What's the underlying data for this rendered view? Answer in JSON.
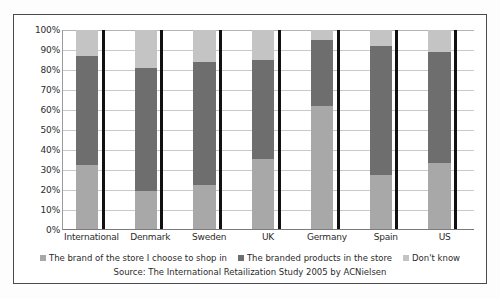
{
  "chart_data": {
    "type": "bar",
    "subtype": "stacked-100-percent",
    "title": "",
    "subtitle": "",
    "xlabel": "",
    "ylabel": "",
    "ylim": [
      0,
      100
    ],
    "grid": true,
    "legend_position": "bottom",
    "y_tick_labels": [
      "100%",
      "90%",
      "80%",
      "70%",
      "60%",
      "50%",
      "40%",
      "30%",
      "20%",
      "10%",
      "0%"
    ],
    "y_tick_values": [
      100,
      90,
      80,
      70,
      60,
      50,
      40,
      30,
      20,
      10,
      0
    ],
    "categories": [
      "International",
      "Denmark",
      "Sweden",
      "UK",
      "Germany",
      "Spain",
      "US"
    ],
    "series": [
      {
        "name": "The brand of the store I choose to shop in",
        "color": "#a8a8a8",
        "values": [
          32,
          19,
          22,
          35,
          62,
          27,
          33
        ]
      },
      {
        "name": "The branded products in the store",
        "color": "#6e6e6e",
        "values": [
          55,
          62,
          62,
          50,
          33,
          65,
          56
        ]
      },
      {
        "name": "Don't know",
        "color": "#c4c4c4",
        "values": [
          13,
          19,
          16,
          15,
          5,
          8,
          11
        ]
      }
    ],
    "source_note": "Source: The International Retailization Study 2005 by ACNielsen"
  },
  "colors": {
    "series_1": "#a8a8a8",
    "series_2": "#6e6e6e",
    "series_3": "#c4c4c4",
    "separator": "#111114",
    "gridline": "#c9c9c9",
    "frame_border": "#4a4a52",
    "text": "#2b2b2b",
    "background": "#ffffff"
  }
}
